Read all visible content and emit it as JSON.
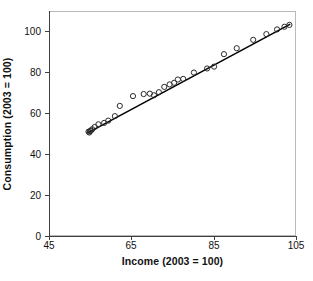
{
  "figure": {
    "background": "#ffffff",
    "frame_color": "#b9b9b9",
    "axis_color": "#404040",
    "marker_color": "#2b2b2b",
    "line_color": "#000000",
    "caption_fragment": ""
  },
  "chart_data": {
    "type": "scatter",
    "title": "",
    "xlabel": "Income (2003 = 100)",
    "ylabel": "Consumption (2003 = 100)",
    "xlim": [
      45,
      105
    ],
    "ylim": [
      0,
      110
    ],
    "xticks": [
      45,
      65,
      85,
      105
    ],
    "yticks": [
      0,
      20,
      40,
      60,
      80,
      100
    ],
    "xtick_labels": [
      "45",
      "65",
      "85",
      "105"
    ],
    "ytick_labels": [
      "0",
      "20",
      "40",
      "60",
      "80",
      "100"
    ],
    "grid": false,
    "legend": null,
    "marker": "open-circle",
    "series": [
      {
        "name": "Observations",
        "x": [
          54.6,
          54.8,
          55.0,
          55.2,
          55.5,
          56.1,
          57.0,
          58.4,
          59.4,
          61.0,
          62.2,
          65.4,
          68.0,
          69.5,
          70.5,
          71.7,
          73.0,
          74.3,
          75.4,
          76.3,
          77.6,
          80.2,
          83.4,
          85.1,
          87.5,
          90.6,
          94.6,
          97.8,
          100.4,
          102.2,
          103.4
        ],
        "y": [
          51.0,
          50.6,
          51.3,
          51.6,
          52.2,
          53.3,
          54.6,
          55.3,
          56.4,
          58.6,
          63.6,
          68.4,
          69.4,
          69.6,
          68.8,
          70.3,
          72.9,
          74.1,
          74.9,
          76.5,
          76.8,
          79.9,
          81.9,
          82.8,
          88.9,
          91.8,
          95.9,
          98.7,
          101.0,
          102.3,
          103.2
        ]
      }
    ],
    "fit_line": {
      "name": "Fitted regression line",
      "x": [
        54.3,
        103.6
      ],
      "y": [
        50.3,
        103.6
      ]
    }
  }
}
